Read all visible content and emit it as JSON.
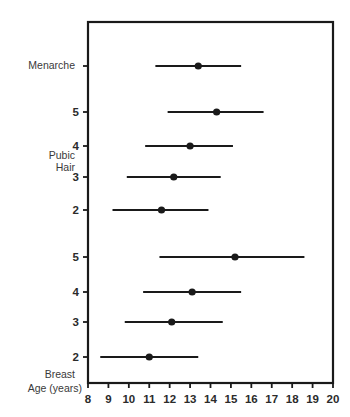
{
  "chart_data": {
    "type": "scatter",
    "title": "",
    "subtitle": "",
    "xlabel": "Age (years)",
    "ylabel": "",
    "xlim": [
      8,
      20
    ],
    "grid": false,
    "legend": null,
    "xticks": [
      "8",
      "9",
      "10",
      "11",
      "12",
      "13",
      "14",
      "15",
      "16",
      "17",
      "18",
      "19",
      "20"
    ],
    "xtick_values": [
      8,
      9,
      10,
      11,
      12,
      13,
      14,
      15,
      16,
      17,
      18,
      19,
      20
    ],
    "group_labels": [
      {
        "text": "Menarche",
        "row": "menarche"
      },
      {
        "text": "Pubic",
        "row": "pubic-hair-1"
      },
      {
        "text": "Hair",
        "row": "pubic-hair-2"
      },
      {
        "text": "Breast",
        "row": "breast"
      },
      {
        "text": "Age (years)",
        "row": "axis"
      }
    ],
    "rows": [
      {
        "id": "menarche",
        "stage_label": "",
        "group": "Menarche",
        "mean": 13.4,
        "low": 11.3,
        "high": 15.5,
        "y": 66
      },
      {
        "id": "ph5",
        "stage_label": "5",
        "group": "Pubic Hair",
        "mean": 14.3,
        "low": 11.9,
        "high": 16.6,
        "y": 112
      },
      {
        "id": "ph4",
        "stage_label": "4",
        "group": "Pubic Hair",
        "mean": 13.0,
        "low": 10.8,
        "high": 15.1,
        "y": 146
      },
      {
        "id": "ph3",
        "stage_label": "3",
        "group": "Pubic Hair",
        "mean": 12.2,
        "low": 9.9,
        "high": 14.5,
        "y": 177
      },
      {
        "id": "ph2",
        "stage_label": "2",
        "group": "Pubic Hair",
        "mean": 11.6,
        "low": 9.2,
        "high": 13.9,
        "y": 210
      },
      {
        "id": "br5",
        "stage_label": "5",
        "group": "Breast",
        "mean": 15.2,
        "low": 11.5,
        "high": 18.6,
        "y": 257
      },
      {
        "id": "br4",
        "stage_label": "4",
        "group": "Breast",
        "mean": 13.1,
        "low": 10.7,
        "high": 15.5,
        "y": 292
      },
      {
        "id": "br3",
        "stage_label": "3",
        "group": "Breast",
        "mean": 12.1,
        "low": 9.8,
        "high": 14.6,
        "y": 322
      },
      {
        "id": "br2",
        "stage_label": "2",
        "group": "Breast",
        "mean": 11.0,
        "low": 8.6,
        "high": 13.4,
        "y": 357
      }
    ],
    "colors": {
      "line": "#1a1a1a",
      "marker": "#1a1a1a",
      "text": "#2b2b2b",
      "background": "#ffffff"
    },
    "geometry": {
      "x_min_px": 88,
      "x_max_px": 333,
      "plot_top_px": 22,
      "plot_bottom_px": 383,
      "xtick_label_y": 400,
      "menarche_label_y": 66,
      "pubic_label_y1": 156,
      "pubic_label_y2": 168,
      "breast_label_y": 375,
      "age_label_y": 389
    }
  }
}
